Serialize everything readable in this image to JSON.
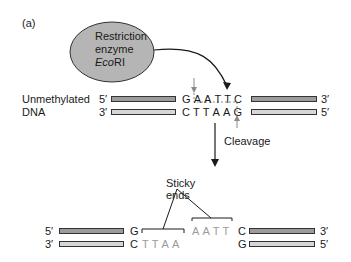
{
  "panel_label": "(a)",
  "enzyme": {
    "line1": "Restriction",
    "line2": "enzyme",
    "line3_italic": "Eco",
    "line3_roman": "RI"
  },
  "dna_label": {
    "line1": "Unmethylated",
    "line2": "DNA"
  },
  "top_strand": {
    "left_end": "5′",
    "right_end": "3′",
    "bases": [
      "G",
      "A",
      "A",
      "T",
      "T",
      "C"
    ]
  },
  "bottom_strand": {
    "left_end": "3′",
    "right_end": "5′",
    "bases": [
      "C",
      "T",
      "T",
      "A",
      "A",
      "G"
    ]
  },
  "cleavage_label": "Cleavage",
  "sticky_label": {
    "line1": "Sticky",
    "line2": "ends"
  },
  "fragment_left": {
    "top_end": "5′",
    "bottom_end": "3′",
    "top_base": "G",
    "bottom_base": "C",
    "overhang": [
      "T",
      "T",
      "A",
      "A"
    ]
  },
  "fragment_right": {
    "top_end": "3′",
    "bottom_end": "5′",
    "top_base": "C",
    "bottom_base": "G",
    "overhang": [
      "A",
      "A",
      "T",
      "T"
    ]
  },
  "colors": {
    "enzyme_fill": "#b5b5b5",
    "strand_dark": "#9c9c9c",
    "strand_light": "#d6d6d6",
    "overhang_text": "#9a9a9a",
    "arrow": "#1a1a1a",
    "cut_arrow": "#8a8a8a"
  }
}
